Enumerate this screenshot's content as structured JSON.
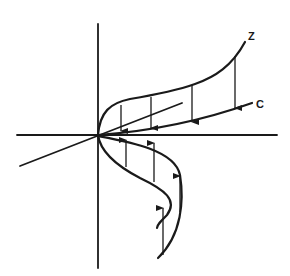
{
  "diagram": {
    "type": "3d-axes-curve-projection",
    "labels": {
      "z": "Z",
      "c": "C"
    },
    "elements": {
      "axes": [
        "vertical-axis",
        "horizontal-axis",
        "depth-axis"
      ],
      "curves": [
        "curve-z",
        "line-c",
        "spiral-curve"
      ],
      "arrows_down_count": 4,
      "arrows_up_count": 4
    },
    "colors": {
      "ink": "#1a1a1a",
      "background": "#ffffff"
    }
  }
}
